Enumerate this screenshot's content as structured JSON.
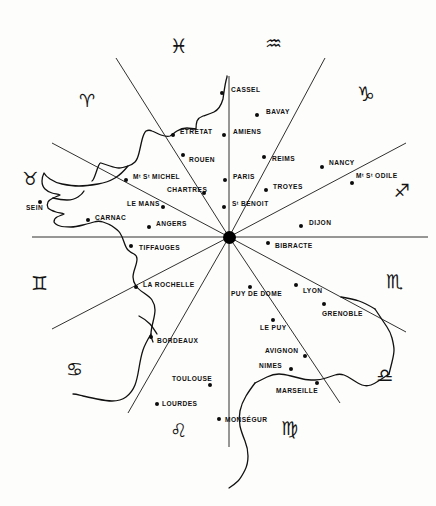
{
  "figure": {
    "width": 436,
    "height": 506,
    "background_color": "#fdfdfb",
    "ink_color": "#101010"
  },
  "center_hub": {
    "name": "center-hub",
    "x": 229,
    "y": 237,
    "radius": 6.5,
    "color": "#000000"
  },
  "spokes": {
    "count": 12,
    "color": "#1a1a1a",
    "lines": [
      {
        "name": "spoke-north",
        "x1": 229,
        "y1": 237,
        "x2": 229,
        "y2": 76
      },
      {
        "name": "spoke-south",
        "x1": 229,
        "y1": 237,
        "x2": 229,
        "y2": 447
      },
      {
        "name": "spoke-east",
        "x1": 229,
        "y1": 237,
        "x2": 428,
        "y2": 237
      },
      {
        "name": "spoke-west",
        "x1": 229,
        "y1": 237,
        "x2": 32,
        "y2": 237
      },
      {
        "name": "spoke-nnw-pisces",
        "x1": 229,
        "y1": 237,
        "x2": 116,
        "y2": 58
      },
      {
        "name": "spoke-nne-aquarius",
        "x1": 229,
        "y1": 237,
        "x2": 325,
        "y2": 58
      },
      {
        "name": "spoke-wnw-aries",
        "x1": 229,
        "y1": 237,
        "x2": 52,
        "y2": 143
      },
      {
        "name": "spoke-ene-capricorn",
        "x1": 229,
        "y1": 237,
        "x2": 406,
        "y2": 143
      },
      {
        "name": "spoke-wsw-gemini",
        "x1": 229,
        "y1": 237,
        "x2": 52,
        "y2": 329
      },
      {
        "name": "spoke-ese-scorpio",
        "x1": 229,
        "y1": 237,
        "x2": 406,
        "y2": 332
      },
      {
        "name": "spoke-ssw-cancer",
        "x1": 229,
        "y1": 237,
        "x2": 128,
        "y2": 413
      },
      {
        "name": "spoke-sse-virgo",
        "x1": 229,
        "y1": 237,
        "x2": 340,
        "y2": 403
      }
    ]
  },
  "zodiac_signs": [
    {
      "name": "zodiac-pisces",
      "glyph": "♓",
      "label": "Pisces",
      "x": 170,
      "y": 36,
      "size": 20,
      "rotate": 0
    },
    {
      "name": "zodiac-aquarius",
      "glyph": "♒",
      "label": "Aquarius",
      "x": 265,
      "y": 34,
      "size": 19,
      "rotate": 0
    },
    {
      "name": "zodiac-aries",
      "glyph": "♈",
      "label": "Aries",
      "x": 79,
      "y": 92,
      "size": 18,
      "rotate": 0
    },
    {
      "name": "zodiac-capricorn",
      "glyph": "♑",
      "label": "Capricorn",
      "x": 357,
      "y": 84,
      "size": 20,
      "rotate": 0
    },
    {
      "name": "zodiac-taurus",
      "glyph": "♉",
      "label": "Taurus",
      "x": 22,
      "y": 170,
      "size": 18,
      "rotate": 0
    },
    {
      "name": "zodiac-sagittarius",
      "glyph": "♐",
      "label": "Sagittarius",
      "x": 394,
      "y": 182,
      "size": 18,
      "rotate": 0
    },
    {
      "name": "zodiac-gemini",
      "glyph": "♊",
      "label": "Gemini",
      "x": 31,
      "y": 274,
      "size": 19,
      "rotate": 0
    },
    {
      "name": "zodiac-scorpio",
      "glyph": "♏",
      "label": "Scorpio",
      "x": 386,
      "y": 272,
      "size": 19,
      "rotate": 0
    },
    {
      "name": "zodiac-cancer",
      "glyph": "♋",
      "label": "Cancer",
      "x": 66,
      "y": 360,
      "size": 19,
      "rotate": 0
    },
    {
      "name": "zodiac-libra",
      "glyph": "♎",
      "label": "Libra",
      "x": 376,
      "y": 366,
      "size": 19,
      "rotate": 0
    },
    {
      "name": "zodiac-leo",
      "glyph": "♌",
      "label": "Leo",
      "x": 170,
      "y": 421,
      "size": 19,
      "rotate": 0
    },
    {
      "name": "zodiac-virgo",
      "glyph": "♍",
      "label": "Virgo",
      "x": 281,
      "y": 419,
      "size": 19,
      "rotate": 0
    }
  ],
  "cities": [
    {
      "name": "city-cassel",
      "label": "CASSEL",
      "dot_x": 222,
      "dot_y": 93,
      "label_x": 231,
      "label_y": 90,
      "align": "left"
    },
    {
      "name": "city-bavay",
      "label": "BAVAY",
      "dot_x": 257,
      "dot_y": 115,
      "label_x": 266,
      "label_y": 112,
      "align": "left"
    },
    {
      "name": "city-etretat",
      "label": "ETRETAT",
      "dot_x": 173,
      "dot_y": 135,
      "label_x": 180,
      "label_y": 132,
      "align": "left"
    },
    {
      "name": "city-amiens",
      "label": "AMIENS",
      "dot_x": 224,
      "dot_y": 135,
      "label_x": 233,
      "label_y": 132,
      "align": "left"
    },
    {
      "name": "city-rouen",
      "label": "ROUEN",
      "dot_x": 183,
      "dot_y": 155,
      "label_x": 189,
      "label_y": 160,
      "align": "left"
    },
    {
      "name": "city-reims",
      "label": "REIMS",
      "dot_x": 264,
      "dot_y": 157,
      "label_x": 272,
      "label_y": 159,
      "align": "left"
    },
    {
      "name": "city-nancy",
      "label": "NANCY",
      "dot_x": 322,
      "dot_y": 167,
      "label_x": 329,
      "label_y": 163,
      "align": "left"
    },
    {
      "name": "city-mont-st-michel",
      "label": "Mᵗ Sᵗ MICHEL",
      "dot_x": 126,
      "dot_y": 180,
      "label_x": 133,
      "label_y": 177,
      "align": "left"
    },
    {
      "name": "city-paris",
      "label": "PARIS",
      "dot_x": 225,
      "dot_y": 180,
      "label_x": 233,
      "label_y": 177,
      "align": "left"
    },
    {
      "name": "city-mont-ste-odile",
      "label": "Mᵗ Sᵗ ODILE",
      "dot_x": 352,
      "dot_y": 183,
      "label_x": 356,
      "label_y": 176,
      "align": "left"
    },
    {
      "name": "city-troyes",
      "label": "TROYES",
      "dot_x": 266,
      "dot_y": 190,
      "label_x": 273,
      "label_y": 187,
      "align": "left"
    },
    {
      "name": "city-chartres",
      "label": "CHARTRES",
      "dot_x": 204,
      "dot_y": 193,
      "label_x": 167,
      "label_y": 190,
      "align": "left"
    },
    {
      "name": "city-le-mans",
      "label": "LE MANS",
      "dot_x": 163,
      "dot_y": 207,
      "label_x": 127,
      "label_y": 204,
      "align": "left"
    },
    {
      "name": "city-sein",
      "label": "SEIN",
      "dot_x": 40,
      "dot_y": 202,
      "label_x": 26,
      "label_y": 208,
      "align": "left"
    },
    {
      "name": "city-st-benoit",
      "label": "Sᵗ BENOIT",
      "dot_x": 224,
      "dot_y": 207,
      "label_x": 232,
      "label_y": 204,
      "align": "left"
    },
    {
      "name": "city-carnac",
      "label": "CARNAC",
      "dot_x": 88,
      "dot_y": 220,
      "label_x": 95,
      "label_y": 218,
      "align": "left"
    },
    {
      "name": "city-angers",
      "label": "ANGERS",
      "dot_x": 149,
      "dot_y": 227,
      "label_x": 156,
      "label_y": 224,
      "align": "left"
    },
    {
      "name": "city-dijon",
      "label": "DIJON",
      "dot_x": 301,
      "dot_y": 226,
      "label_x": 309,
      "label_y": 223,
      "align": "left"
    },
    {
      "name": "city-bibracte",
      "label": "BIBRACTE",
      "dot_x": 268,
      "dot_y": 243,
      "label_x": 275,
      "label_y": 246,
      "align": "left"
    },
    {
      "name": "city-tiffauges",
      "label": "TIFFAUGES",
      "dot_x": 131,
      "dot_y": 246,
      "label_x": 139,
      "label_y": 248,
      "align": "left"
    },
    {
      "name": "city-la-rochelle",
      "label": "LA ROCHELLE",
      "dot_x": 136,
      "dot_y": 287,
      "label_x": 143,
      "label_y": 285,
      "align": "left"
    },
    {
      "name": "city-puy-de-dome",
      "label": "PUY DE DOME",
      "dot_x": 250,
      "dot_y": 287,
      "label_x": 231,
      "label_y": 294,
      "align": "left"
    },
    {
      "name": "city-lyon",
      "label": "LYON",
      "dot_x": 296,
      "dot_y": 285,
      "label_x": 303,
      "label_y": 291,
      "align": "left"
    },
    {
      "name": "city-grenoble",
      "label": "GRENOBLE",
      "dot_x": 324,
      "dot_y": 304,
      "label_x": 322,
      "label_y": 314,
      "align": "left"
    },
    {
      "name": "city-le-puy",
      "label": "LE PUY",
      "dot_x": 273,
      "dot_y": 320,
      "label_x": 260,
      "label_y": 328,
      "align": "left"
    },
    {
      "name": "city-bordeaux",
      "label": "BORDEAUX",
      "dot_x": 151,
      "dot_y": 337,
      "label_x": 157,
      "label_y": 341,
      "align": "left"
    },
    {
      "name": "city-avignon",
      "label": "AVIGNON",
      "dot_x": 305,
      "dot_y": 356,
      "label_x": 265,
      "label_y": 351,
      "align": "left"
    },
    {
      "name": "city-nimes",
      "label": "NIMES",
      "dot_x": 291,
      "dot_y": 369,
      "label_x": 259,
      "label_y": 366,
      "align": "left"
    },
    {
      "name": "city-toulouse",
      "label": "TOULOUSE",
      "dot_x": 210,
      "dot_y": 385,
      "label_x": 172,
      "label_y": 379,
      "align": "left"
    },
    {
      "name": "city-marseille",
      "label": "MARSEILLE",
      "dot_x": 317,
      "dot_y": 383,
      "label_x": 276,
      "label_y": 391,
      "align": "left"
    },
    {
      "name": "city-lourdes",
      "label": "LOURDES",
      "dot_x": 157,
      "dot_y": 404,
      "label_x": 162,
      "label_y": 404,
      "align": "left"
    },
    {
      "name": "city-monsegur",
      "label": "MONSÉGUR",
      "dot_x": 219,
      "dot_y": 419,
      "label_x": 225,
      "label_y": 420,
      "align": "left"
    }
  ],
  "coastline": {
    "name": "france-coastline",
    "stroke_color": "#111111",
    "stroke_width": 1.3,
    "paths": [
      "M 227,76 L 227,77 C 225,83 224,92 223,99 C 221,106 218,110 214,112 C 210,114 206,115 203,116 C 200,117 198,119 197,121 C 196,124 196,127 196,129 C 193,129 190,128 187,128 C 183,128 180,129 177,131 C 174,133 172,135 170,136 C 167,137 164,136 161,135 C 158,134 155,132 152,131 C 150,130 148,130 146,131 C 144,133 143,136 142,140 C 141,144 140,149 139,153 C 138,157 137,160 135,162 C 133,164 131,165 128,166 C 125,167 122,168 119,168 C 116,168 113,167 110,166 C 107,165 104,164 101,163 C 98,162 95,180 92,181",
      "M 128,166 C 124,171 120,175 115,178 C 110,181 104,183 98,184 C 92,185 85,186 79,186 C 73,186 67,185 62,184 C 57,183 53,181 50,179 C 47,177 45,175 44,173 C 43,175 42,178 42,181 C 42,184 43,187 45,189 C 47,191 49,192 52,193 C 55,194 58,194 60,195 C 58,196 55,197 53,198 C 51,199 49,200 48,202 C 47,204 47,206 48,208 C 50,210 53,211 56,212 C 59,213 62,213 64,214 C 62,215 59,216 57,217 C 55,218 54,220 54,222 C 55,224 57,225 60,226 C 63,227 67,227 71,227 C 75,227 79,226 83,225 C 87,224 91,223 94,222 C 97,221 100,221 103,222 C 106,223 109,224 112,226 C 115,228 118,230 120,233 C 122,236 123,239 124,242 C 125,245 126,248 128,250 C 130,252 132,253 134,254 C 136,255 137,257 137,259 C 137,262 136,265 135,268 C 134,271 133,274 133,277 C 133,280 134,283 136,286 C 138,289 141,291 144,293 C 147,295 150,297 152,300 C 154,303 155,306 155,310 C 155,314 154,318 153,322 C 152,326 151,330 151,334 C 151,337 152,340 153,342",
      "M 139,316 C 143,318 147,321 150,324 C 153,327 155,331 157,334",
      "M 151,334 C 148,339 145,344 143,350 C 141,356 140,362 139,368 C 138,374 137,380 135,385 C 133,390 130,394 126,397 C 122,400 117,401 112,401 C 107,401 102,400 97,399 C 92,398 87,397 83,396 C 79,395 76,394 73,394",
      "M 53,198 C 57,199 62,200 67,200 C 71,200 75,199 78,197 C 81,195 83,193 84,191",
      "M 255,383 C 259,381 263,379 267,377 C 271,375 275,374 279,374 C 283,374 287,375 291,376 C 295,377 299,378 303,379 C 307,380 311,380 315,380 C 319,380 323,379 326,378 C 329,377 332,376 335,375 C 338,374 341,374 344,375 C 347,376 350,378 353,380 C 356,382 359,384 362,385 C 365,386 368,386 371,385 C 374,384 377,382 380,380 C 383,378 386,376 389,374",
      "M 389,374 C 390,370 391,366 392,362 C 393,358 394,354 394,350 C 394,346 393,342 392,338 C 391,334 389,330 387,327 C 385,324 383,321 381,318 C 379,315 377,312 375,309",
      "M 375,309 C 370,306 365,303 359,301 C 353,299 347,298 341,297",
      "M 255,383 C 252,387 249,391 246,396 C 243,401 241,406 240,411 C 239,416 239,421 240,426 C 241,431 243,436 245,441 C 247,446 248,451 248,456 C 248,461 247,466 245,470 C 243,474 241,478 238,481 C 235,484 232,486 229,488"
    ]
  },
  "credits": {
    "caption": ""
  }
}
